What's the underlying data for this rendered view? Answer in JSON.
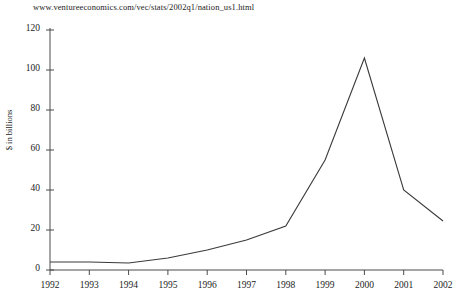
{
  "page": {
    "source_url": "www.ventureeconomics.com/vec/stats/2002q1/nation_us1.html",
    "background_color": "#ffffff",
    "line_color": "#3a3a3a",
    "axis_color": "#4a4a4a"
  },
  "chart_data": {
    "type": "line",
    "title": "",
    "xlabel": "",
    "ylabel": "$ in billions",
    "categories": [
      "1992",
      "1993",
      "1994",
      "1995",
      "1996",
      "1997",
      "1998",
      "1999",
      "2000",
      "2001",
      "2002"
    ],
    "values": [
      4,
      4,
      3.5,
      6,
      10,
      15,
      22,
      55,
      106,
      40,
      24.5
    ],
    "ylim": [
      0,
      120
    ],
    "ytick_values": [
      0,
      20,
      40,
      60,
      80,
      100,
      120
    ],
    "ytick_labels": [
      "0",
      "20",
      "40",
      "60",
      "80",
      "100",
      "120"
    ],
    "xtick_labels": [
      "1992",
      "1993",
      "1994",
      "1995",
      "1996",
      "1997",
      "1998",
      "1999",
      "2000",
      "2001",
      "2002"
    ],
    "grid": false,
    "legend": false,
    "series": [
      {
        "name": "Venture capital invested",
        "values": [
          4,
          4,
          3.5,
          6,
          10,
          15,
          22,
          55,
          106,
          40,
          24.5
        ]
      }
    ]
  }
}
